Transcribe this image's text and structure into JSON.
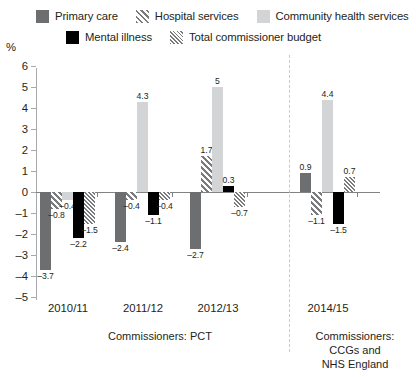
{
  "axis": {
    "unit_label": "%",
    "y_ticks": [
      "6",
      "5",
      "4",
      "3",
      "2",
      "1",
      "0",
      "–1",
      "–2",
      "–3",
      "–4",
      "–5"
    ],
    "y_min": -5,
    "y_max": 6
  },
  "legend": {
    "rows": [
      [
        {
          "label": "Primary care",
          "swatch": "sw-primary",
          "icon": "solid-dark-gray-swatch"
        },
        {
          "label": "Hospital services",
          "swatch": "sw-hospital",
          "icon": "diagonal-hatch-swatch"
        },
        {
          "label": "Community health services",
          "swatch": "sw-community",
          "icon": "solid-light-gray-swatch"
        }
      ],
      [
        {
          "label": "Mental illness",
          "swatch": "sw-mental",
          "icon": "solid-black-swatch"
        },
        {
          "label": "Total commissioner budget",
          "swatch": "sw-total",
          "icon": "fine-hatch-swatch"
        }
      ]
    ]
  },
  "captions": {
    "left": "Commissioners: PCT",
    "right": "Commissioners:\nCCGs and\nNHS England"
  },
  "chart_data": {
    "type": "bar",
    "title": "",
    "xlabel": "",
    "ylabel": "%",
    "ylim": [
      -5,
      6
    ],
    "grid": false,
    "legend_position": "top",
    "categories": [
      "2010/11",
      "2011/12",
      "2012/13",
      "2014/15"
    ],
    "series": [
      {
        "name": "Primary care",
        "style": "solid-dark-gray",
        "values": [
          -3.7,
          -2.4,
          -2.7,
          0.9
        ],
        "labels": [
          "–3.7",
          "–2.4",
          "–2.7",
          "0.9"
        ]
      },
      {
        "name": "Hospital services",
        "style": "diagonal-hatch",
        "values": [
          -0.8,
          -0.4,
          1.7,
          -1.1
        ],
        "labels": [
          "–0.8",
          "–0.4",
          "1.7",
          "–1.1"
        ]
      },
      {
        "name": "Community health services",
        "style": "solid-light-gray",
        "values": [
          -0.4,
          4.3,
          5,
          4.4
        ],
        "labels": [
          "–0.4",
          "4.3",
          "5",
          "4.4"
        ]
      },
      {
        "name": "Mental illness",
        "style": "solid-black",
        "values": [
          -2.2,
          -1.1,
          0.3,
          -1.5
        ],
        "labels": [
          "–2.2",
          "–1.1",
          "0.3",
          "–1.5"
        ]
      },
      {
        "name": "Total commissioner budget",
        "style": "fine-hatch",
        "values": [
          -1.5,
          -0.4,
          -0.7,
          0.7
        ],
        "labels": [
          "–1.5",
          "–0.4",
          "–0.7",
          "0.7"
        ]
      }
    ],
    "annotations": {
      "divider": "dashed vertical line separating PCT years from CCG/NHS England year"
    }
  }
}
